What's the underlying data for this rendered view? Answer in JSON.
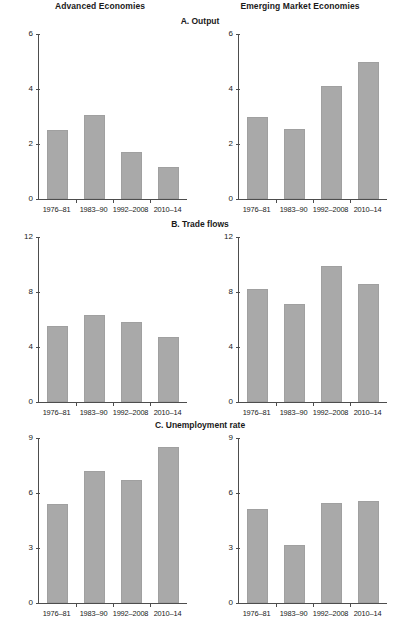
{
  "columns": [
    {
      "label": "Advanced Economies"
    },
    {
      "label": "Emerging Market Economies"
    }
  ],
  "categories": [
    "1976–81",
    "1983–90",
    "1992–2008",
    "2010–14"
  ],
  "bar_color": "#a9a9a9",
  "axis_color": "#4d4d4d",
  "panels": [
    {
      "id": "a",
      "title": "A. Output",
      "ylim": [
        0,
        6
      ],
      "yticks": [
        "0",
        "2",
        "4",
        "6"
      ],
      "charts": [
        {
          "column": "Advanced Economies",
          "values": [
            2.5,
            3.05,
            1.7,
            1.15
          ]
        },
        {
          "column": "Emerging Market Economies",
          "values": [
            3.0,
            2.55,
            4.1,
            5.0
          ]
        }
      ]
    },
    {
      "id": "b",
      "title": "B. Trade flows",
      "ylim": [
        0,
        12
      ],
      "yticks": [
        "0",
        "4",
        "8",
        "12"
      ],
      "charts": [
        {
          "column": "Advanced Economies",
          "values": [
            5.5,
            6.3,
            5.85,
            4.7
          ]
        },
        {
          "column": "Emerging Market Economies",
          "values": [
            8.2,
            7.1,
            9.9,
            8.6
          ]
        }
      ]
    },
    {
      "id": "c",
      "title": "C. Unemployment rate",
      "ylim": [
        0,
        9
      ],
      "yticks": [
        "0",
        "3",
        "6",
        "9"
      ],
      "charts": [
        {
          "column": "Advanced Economies",
          "values": [
            5.4,
            7.2,
            6.7,
            8.5
          ]
        },
        {
          "column": "Emerging Market Economies",
          "values": [
            5.15,
            3.15,
            5.45,
            5.55
          ]
        }
      ]
    }
  ],
  "chart_data": [
    {
      "type": "bar",
      "title": "A. Output — Advanced Economies",
      "categories": [
        "1976–81",
        "1983–90",
        "1992–2008",
        "2010–14"
      ],
      "values": [
        2.5,
        3.05,
        1.7,
        1.15
      ],
      "xlabel": "",
      "ylabel": "",
      "ylim": [
        0,
        6
      ],
      "yticks": [
        0,
        2,
        4,
        6
      ],
      "grid": false,
      "legend": "none"
    },
    {
      "type": "bar",
      "title": "A. Output — Emerging Market Economies",
      "categories": [
        "1976–81",
        "1983–90",
        "1992–2008",
        "2010–14"
      ],
      "values": [
        3.0,
        2.55,
        4.1,
        5.0
      ],
      "xlabel": "",
      "ylabel": "",
      "ylim": [
        0,
        6
      ],
      "yticks": [
        0,
        2,
        4,
        6
      ],
      "grid": false,
      "legend": "none"
    },
    {
      "type": "bar",
      "title": "B. Trade flows — Advanced Economies",
      "categories": [
        "1976–81",
        "1983–90",
        "1992–2008",
        "2010–14"
      ],
      "values": [
        5.5,
        6.3,
        5.85,
        4.7
      ],
      "xlabel": "",
      "ylabel": "",
      "ylim": [
        0,
        12
      ],
      "yticks": [
        0,
        4,
        8,
        12
      ],
      "grid": false,
      "legend": "none"
    },
    {
      "type": "bar",
      "title": "B. Trade flows — Emerging Market Economies",
      "categories": [
        "1976–81",
        "1983–90",
        "1992–2008",
        "2010–14"
      ],
      "values": [
        8.2,
        7.1,
        9.9,
        8.6
      ],
      "xlabel": "",
      "ylabel": "",
      "ylim": [
        0,
        12
      ],
      "yticks": [
        0,
        4,
        8,
        12
      ],
      "grid": false,
      "legend": "none"
    },
    {
      "type": "bar",
      "title": "C. Unemployment rate — Advanced Economies",
      "categories": [
        "1976–81",
        "1983–90",
        "1992–2008",
        "2010–14"
      ],
      "values": [
        5.4,
        7.2,
        6.7,
        8.5
      ],
      "xlabel": "",
      "ylabel": "",
      "ylim": [
        0,
        9
      ],
      "yticks": [
        0,
        3,
        6,
        9
      ],
      "grid": false,
      "legend": "none"
    },
    {
      "type": "bar",
      "title": "C. Unemployment rate — Emerging Market Economies",
      "categories": [
        "1976–81",
        "1983–90",
        "1992–2008",
        "2010–14"
      ],
      "values": [
        5.15,
        3.15,
        5.45,
        5.55
      ],
      "xlabel": "",
      "ylabel": "",
      "ylim": [
        0,
        9
      ],
      "yticks": [
        0,
        3,
        6,
        9
      ],
      "grid": false,
      "legend": "none"
    }
  ]
}
